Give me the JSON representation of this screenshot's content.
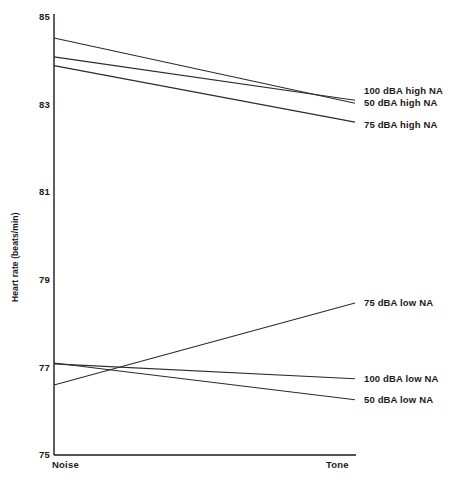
{
  "figure": {
    "caption": "",
    "line_color": "#2b2b2b",
    "axis_color": "#1a1a1a",
    "background": "#ffffff"
  },
  "axes": {
    "ylabel": "Heart rate (beats/min)",
    "yticks": [
      "85",
      "83",
      "81",
      "79",
      "77",
      "75"
    ],
    "xticks": [
      "Noise",
      "Tone"
    ]
  },
  "series_labels": {
    "s0": "100 dBA high NA",
    "s1": "50 dBA high NA",
    "s2": "75 dBA high NA",
    "s3": "75 dBA low NA",
    "s4": "100 dBA low NA",
    "s5": "50 dBA low NA"
  },
  "chart_data": {
    "type": "line",
    "title": "",
    "xlabel": "",
    "ylabel": "Heart rate (beats/min)",
    "categories": [
      "Noise",
      "Tone"
    ],
    "x": [
      "Noise",
      "Tone"
    ],
    "ylim": [
      75,
      85
    ],
    "ytick_values": [
      85,
      83,
      81,
      79,
      77,
      75
    ],
    "grid": false,
    "legend_position": "right-inline-labels",
    "series": [
      {
        "name": "100 dBA high NA",
        "values": [
          84.52,
          83.03
        ]
      },
      {
        "name": "50 dBA high NA",
        "values": [
          84.09,
          83.1
        ]
      },
      {
        "name": "75 dBA high NA",
        "values": [
          83.89,
          82.6
        ]
      },
      {
        "name": "75 dBA low NA",
        "values": [
          76.6,
          78.47
        ]
      },
      {
        "name": "100 dBA low NA",
        "values": [
          77.08,
          76.74
        ]
      },
      {
        "name": "50 dBA low NA",
        "values": [
          77.1,
          76.26
        ]
      }
    ],
    "annotations": [
      "Lines for high NA groups all decline from Noise to Tone.",
      "75 dBA low NA rises from Noise to Tone; 100 and 50 dBA low NA decline."
    ]
  }
}
